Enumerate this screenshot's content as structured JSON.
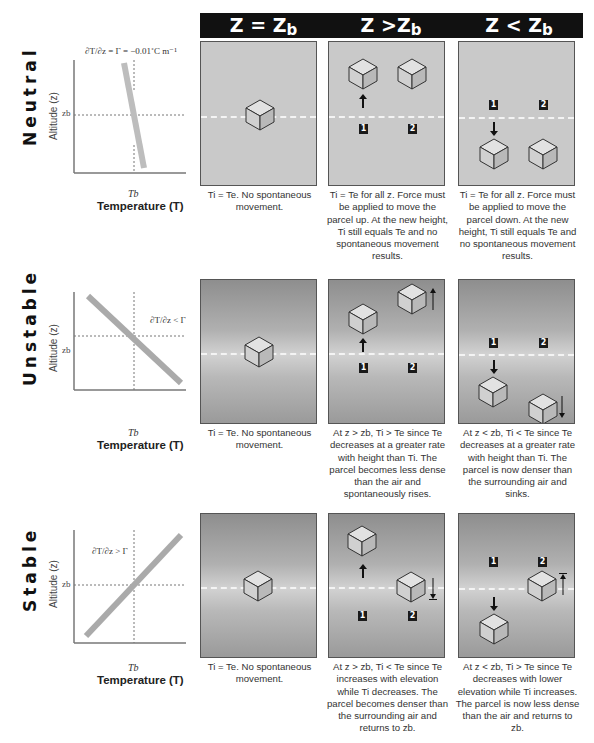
{
  "header": {
    "columns": [
      {
        "label": "Z = Z",
        "sub": "b"
      },
      {
        "label": "Z >Z",
        "sub": "b"
      },
      {
        "label": "Z < Z",
        "sub": "b"
      }
    ]
  },
  "rows": [
    {
      "label": "Neutral",
      "graph": {
        "annotation": "∂T/∂z = Γ = −0.01˚C m⁻¹",
        "y_axis_label": "Altitude (z)",
        "y_tick": "zb",
        "x_tick": "Tb",
        "x_axis_label": "Temperature (T)"
      },
      "captions": [
        "Ti = Te. No spontaneous movement.",
        "Ti = Te for all z. Force must be applied to move the parcel up. At the new height, Ti still equals Te and no spontaneous movement results.",
        "Ti = Te for all z. Force must be applied to move the parcel down. At the new height, Ti still equals Te and no spontaneous movement results."
      ]
    },
    {
      "label": "Unstable",
      "graph": {
        "annotation": "∂T/∂z < Γ",
        "y_axis_label": "Altitude (z)",
        "y_tick": "zb",
        "x_tick": "Tb",
        "x_axis_label": "Temperature (T)"
      },
      "captions": [
        "Ti = Te. No spontaneous movement.",
        "At z > zb, Ti > Te since Te decreases at a greater rate with height than Ti. The parcel becomes less dense than the air and spontaneously rises.",
        "At z < zb, Ti < Te since Te decreases at a greater rate with height than Ti. The parcel is now denser than the surrounding air and sinks."
      ]
    },
    {
      "label": "Stable",
      "graph": {
        "annotation": "∂T/∂z > Γ",
        "y_axis_label": "Altitude (z)",
        "y_tick": "zb",
        "x_tick": "Tb",
        "x_axis_label": "Temperature (T)"
      },
      "captions": [
        "Ti = Te. No spontaneous movement.",
        "At z > zb, Ti < Te since Te increases with elevation while Ti decreases. The parcel becomes denser than the surrounding air and returns to zb.",
        "At z < zb, Ti > Te since Te decreases with lower elevation while Ti increases. The parcel is now less dense than the air and returns to zb."
      ]
    }
  ],
  "badges": {
    "one": "1",
    "two": "2"
  },
  "colors": {
    "header_bg": "#111111",
    "panel_flat": "#c9c9c9",
    "lapse_line": "#b5b5b5",
    "cube_top": "#e4e4e4"
  }
}
